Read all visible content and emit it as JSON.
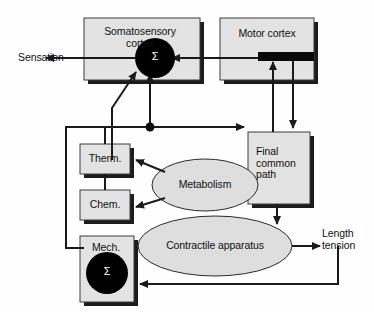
{
  "diagram": {
    "type": "block-flow-diagram",
    "colors": {
      "box_fill": "#e3e3e3",
      "box_stroke": "#3a3a3a",
      "shadow": "#1a1a1a",
      "ellipse_fill": "#dedede",
      "summing_node": "#000000",
      "line": "#1a1a1a",
      "text": "#111111",
      "background": "#ffffff"
    },
    "nodes": [
      {
        "id": "somatosensory_cortex",
        "shape": "box",
        "label": "Somatosensory\ncortex",
        "has_summing_junction": true,
        "summing_symbol": "Σ"
      },
      {
        "id": "motor_cortex",
        "shape": "box",
        "label": "Motor cortex",
        "has_black_bar": true
      },
      {
        "id": "final_common_path",
        "shape": "box",
        "label": "Final\ncommon\npath"
      },
      {
        "id": "therm",
        "shape": "box",
        "label": "Therm."
      },
      {
        "id": "chem",
        "shape": "box",
        "label": "Chem."
      },
      {
        "id": "mech",
        "shape": "box",
        "label": "Mech.",
        "has_summing_junction": true,
        "summing_symbol": "Σ"
      },
      {
        "id": "metabolism",
        "shape": "ellipse",
        "label": "Metabolism"
      },
      {
        "id": "contractile_apparatus",
        "shape": "ellipse",
        "label": "Contractile apparatus"
      }
    ],
    "free_labels": [
      {
        "id": "sensation",
        "label": "Sensation"
      },
      {
        "id": "length_tension",
        "label": "Length\ntension"
      }
    ],
    "edges": [
      {
        "from": "somatosensory_cortex",
        "to": "sensation",
        "arrow": "left"
      },
      {
        "from": "motor_cortex",
        "to": "somatosensory_cortex",
        "arrow": "left"
      },
      {
        "from": "junction",
        "to": "somatosensory_cortex",
        "arrow": "up"
      },
      {
        "from": "mech_bus",
        "to": "somatosensory_cortex",
        "arrow": "diagonal-up-right"
      },
      {
        "from": "junction",
        "to": "final_common_path",
        "arrow": "right"
      },
      {
        "from": "final_common_path",
        "to": "motor_cortex",
        "arrow": "up"
      },
      {
        "from": "motor_cortex",
        "to": "final_common_path",
        "arrow": "down"
      },
      {
        "from": "final_common_path",
        "to": "contractile_apparatus",
        "arrow": "down"
      },
      {
        "from": "metabolism",
        "to": "therm",
        "arrow": "left"
      },
      {
        "from": "metabolism",
        "to": "chem",
        "arrow": "left"
      },
      {
        "from": "contractile_apparatus",
        "to": "length_tension",
        "arrow": "right"
      },
      {
        "from": "length_tension",
        "to": "mech",
        "arrow": "left-feedback"
      },
      {
        "from": "sensor_bus",
        "to": "junction",
        "arrow": "up"
      }
    ]
  }
}
